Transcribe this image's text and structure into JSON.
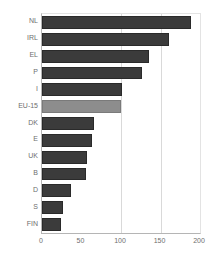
{
  "chart_data": {
    "type": "bar",
    "orientation": "horizontal",
    "title": "",
    "xlabel": "",
    "ylabel": "",
    "xlim": [
      0,
      200
    ],
    "xticks": [
      0,
      50,
      100,
      150,
      200
    ],
    "grid": true,
    "gridlines_at": [
      100,
      150
    ],
    "legend": null,
    "categories": [
      "NL",
      "IRL",
      "EL",
      "P",
      "I",
      "EU-15",
      "DK",
      "E",
      "UK",
      "B",
      "D",
      "S",
      "FIN"
    ],
    "values": [
      188,
      161,
      136,
      126,
      101,
      100,
      66,
      63,
      57,
      56,
      37,
      26,
      24
    ],
    "highlight_category": "EU-15",
    "colors": {
      "bar": "#3b3b3b",
      "bar_border": "#2a2a2a",
      "highlight": "#8d8d8d",
      "highlight_border": "#7a7a7a",
      "axis": "#b5b5b5",
      "grid": "#d9d9d9",
      "label": "#6e6e6e",
      "background": "#ffffff"
    },
    "bars": [
      {
        "category": "NL",
        "value": 188,
        "highlight": false
      },
      {
        "category": "IRL",
        "value": 161,
        "highlight": false
      },
      {
        "category": "EL",
        "value": 136,
        "highlight": false
      },
      {
        "category": "P",
        "value": 126,
        "highlight": false
      },
      {
        "category": "I",
        "value": 101,
        "highlight": false
      },
      {
        "category": "EU-15",
        "value": 100,
        "highlight": true
      },
      {
        "category": "DK",
        "value": 66,
        "highlight": false
      },
      {
        "category": "E",
        "value": 63,
        "highlight": false
      },
      {
        "category": "UK",
        "value": 57,
        "highlight": false
      },
      {
        "category": "B",
        "value": 56,
        "highlight": false
      },
      {
        "category": "D",
        "value": 37,
        "highlight": false
      },
      {
        "category": "S",
        "value": 26,
        "highlight": false
      },
      {
        "category": "FIN",
        "value": 24,
        "highlight": false
      }
    ]
  }
}
